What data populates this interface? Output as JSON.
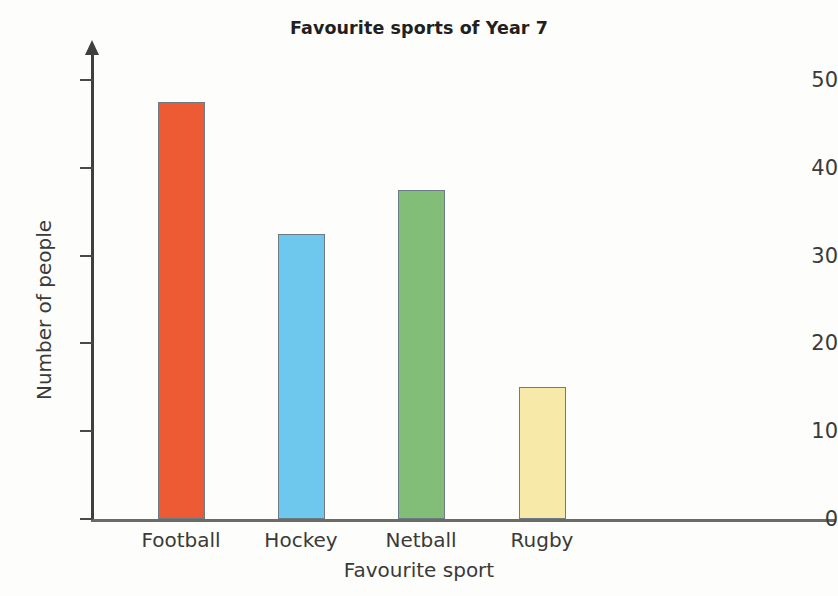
{
  "chart_data": {
    "type": "bar",
    "title": "Favourite sports of Year 7",
    "xlabel": "Favourite sport",
    "ylabel": "Number of people",
    "categories": [
      "Football",
      "Hockey",
      "Netball",
      "Rugby"
    ],
    "values": [
      47.5,
      32.5,
      37.5,
      15
    ],
    "colors": [
      "#ec5b33",
      "#6ec8ee",
      "#82be78",
      "#f7e9a8"
    ],
    "ylim": [
      0,
      52
    ],
    "yticks": [
      0,
      10,
      20,
      30,
      40,
      50
    ],
    "ytick_labels": [
      "0",
      "10",
      "20",
      "30",
      "40",
      "50"
    ],
    "grid": false,
    "legend": false
  }
}
